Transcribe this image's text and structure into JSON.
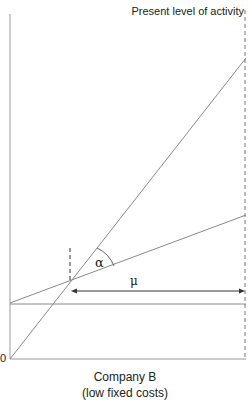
{
  "diagram": {
    "top_label": "Present level of activity",
    "origin_label": "0",
    "angle_label": "α",
    "margin_label": "μ",
    "caption_line1": "Company B",
    "caption_line2": "(low fixed costs)",
    "colors": {
      "line": "#8a8a8a",
      "axis": "#9a9a9a",
      "text": "#222222",
      "dashed": "#777777"
    }
  }
}
